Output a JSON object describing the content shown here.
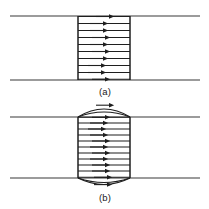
{
  "figure": {
    "background_color": "#ffffff",
    "line_color": "#555555",
    "field_line_color": "#1f1f1f",
    "boundary_color": "#777777",
    "panels": [
      {
        "id": "panel-a",
        "caption": "(a)",
        "caption_x": 105,
        "caption_y": 95,
        "shape": "rectangle",
        "boundary_lines": [
          {
            "name": "upper-boundary-line",
            "x1": 10,
            "x2": 200,
            "y": 16
          },
          {
            "name": "lower-boundary-line",
            "x1": 10,
            "x2": 200,
            "y": 80
          }
        ],
        "box": {
          "left": 78,
          "right": 130,
          "top": 16,
          "bottom": 80
        },
        "field_line_count": 10,
        "field_line_ys": [
          16,
          23,
          30,
          37,
          44,
          51,
          58,
          65,
          72,
          79
        ],
        "arrow_direction": "right",
        "arrow_x": 108
      },
      {
        "id": "panel-b",
        "caption": "(b)",
        "caption_x": 105,
        "caption_y": 200,
        "shape": "rectangle-with-convex-caps",
        "boundary_lines": [
          {
            "name": "upper-boundary-line",
            "x1": 10,
            "x2": 200,
            "y": 117
          },
          {
            "name": "lower-boundary-line",
            "x1": 10,
            "x2": 200,
            "y": 178
          }
        ],
        "box": {
          "left": 78,
          "right": 130,
          "top": 117,
          "bottom": 178
        },
        "cap_bulge": 12,
        "field_line_count": 11,
        "field_line_ys": [
          117,
          123,
          129,
          135,
          141,
          147,
          153,
          159,
          165,
          171,
          177
        ],
        "arc_line_count": 2,
        "arrow_direction": "right",
        "arrow_x": 108
      }
    ]
  }
}
